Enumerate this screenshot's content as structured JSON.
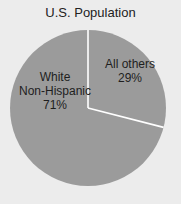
{
  "chart_data": {
    "type": "pie",
    "title": "U.S. Population",
    "categories": [
      "White Non-Hispanic",
      "All others"
    ],
    "values": [
      71,
      29
    ],
    "unit": "%",
    "colors": {
      "slice": "#9b9b9b",
      "divider": "#ffffff",
      "background": "#ececec",
      "text": "#1e1e1e"
    },
    "legend": "none",
    "labels": [
      {
        "line1": "White",
        "line2": "Non-Hispanic",
        "value": "71%"
      },
      {
        "line1": "All others",
        "value": "29%"
      }
    ]
  }
}
